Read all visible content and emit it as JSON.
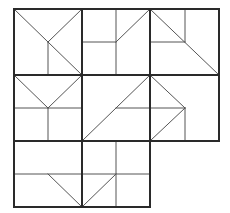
{
  "diagram": {
    "title": "",
    "cell_size": 68,
    "origin": [
      14,
      9
    ],
    "colors": {
      "background": "#ffffff",
      "grid_line": "#2a2a2a",
      "inner_line": "#555555"
    },
    "grid_lines": [
      [
        14,
        9,
        219,
        9
      ],
      [
        14,
        75,
        219,
        75
      ],
      [
        14,
        141,
        219,
        141
      ],
      [
        14,
        207,
        150,
        207
      ],
      [
        14,
        9,
        14,
        207
      ],
      [
        82,
        9,
        82,
        207
      ],
      [
        150,
        9,
        150,
        207
      ],
      [
        219,
        9,
        219,
        141
      ]
    ],
    "cells": [
      {
        "id": "cell-r0-c0",
        "lines": [
          [
            14,
            9,
            82,
            75
          ],
          [
            48,
            42,
            82,
            9
          ],
          [
            48,
            42,
            48,
            75
          ]
        ]
      },
      {
        "id": "cell-r0-c1",
        "lines": [
          [
            116,
            9,
            116,
            75
          ],
          [
            82,
            42,
            116,
            42
          ],
          [
            116,
            42,
            150,
            9
          ]
        ]
      },
      {
        "id": "cell-r0-c2",
        "lines": [
          [
            150,
            9,
            219,
            75
          ],
          [
            185,
            9,
            185,
            42
          ],
          [
            150,
            42,
            185,
            42
          ]
        ]
      },
      {
        "id": "cell-r1-c0",
        "lines": [
          [
            14,
            75,
            48,
            108
          ],
          [
            48,
            108,
            82,
            75
          ],
          [
            14,
            108,
            82,
            108
          ],
          [
            48,
            108,
            48,
            141
          ]
        ]
      },
      {
        "id": "cell-r1-c1",
        "lines": [
          [
            82,
            141,
            150,
            75
          ],
          [
            116,
            108,
            150,
            108
          ]
        ]
      },
      {
        "id": "cell-r1-c2",
        "lines": [
          [
            150,
            75,
            185,
            108
          ],
          [
            185,
            108,
            150,
            141
          ],
          [
            150,
            108,
            185,
            108
          ],
          [
            185,
            108,
            185,
            141
          ]
        ]
      },
      {
        "id": "cell-r2-c0",
        "lines": [
          [
            14,
            174,
            82,
            174
          ],
          [
            48,
            174,
            82,
            207
          ]
        ]
      },
      {
        "id": "cell-r2-c1",
        "lines": [
          [
            116,
            141,
            116,
            207
          ],
          [
            82,
            174,
            150,
            174
          ],
          [
            82,
            207,
            116,
            174
          ]
        ]
      }
    ]
  }
}
